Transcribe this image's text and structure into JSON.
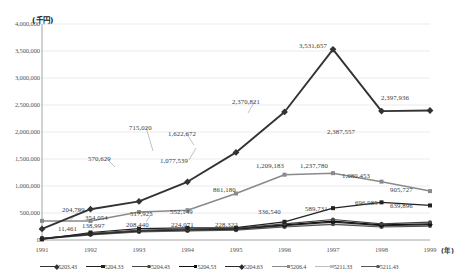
{
  "chart_data": {
    "type": "line",
    "title": "",
    "ylabel": "(千円)",
    "xlabel": "(年)",
    "ylim": [
      0,
      4000000
    ],
    "ytick_labels": [
      "4,000,000",
      "3,500,000",
      "3,000,000",
      "2,500,000",
      "2,000,000",
      "1,500,000",
      "1,000,000",
      "500,000",
      "0"
    ],
    "ytick_values": [
      4000000,
      3500000,
      3000000,
      2500000,
      2000000,
      1500000,
      1000000,
      500000,
      0
    ],
    "grid": true,
    "legend_position": "bottom",
    "categories": [
      "1991",
      "1992",
      "1993",
      "1994",
      "1995",
      "1996",
      "1997",
      "1998",
      "1999"
    ],
    "series": [
      {
        "name": "5203.43",
        "color": "#333333",
        "marker": "diamond",
        "values": [
          204799,
          570629,
          715020,
          1077539,
          1622672,
          2370821,
          3531657,
          2387557,
          2397936
        ],
        "labels": [
          "204,799",
          "570,629",
          "715,020",
          "1,077,539",
          "1,622,672",
          "2,370,821",
          "3,531,657",
          "2,387,557",
          "2,397,936"
        ]
      },
      {
        "name": "5204.33",
        "color": "#222222",
        "marker": "square",
        "values": [
          11461,
          138997,
          208440,
          224071,
          228322,
          336540,
          589731,
          696985,
          639896
        ],
        "labels": [
          "11,461",
          "138,997",
          "208,440",
          "224,071",
          "228,322",
          "336,540",
          "589,731",
          "696,985",
          "639,896"
        ]
      },
      {
        "name": "5204.43",
        "color": "#444444",
        "marker": "circle",
        "values": [
          30000,
          120000,
          180000,
          200000,
          215000,
          300000,
          380000,
          300000,
          330000
        ],
        "labels": [
          "",
          "",
          "",
          "",
          "",
          "",
          "",
          "",
          ""
        ]
      },
      {
        "name": "5204.53",
        "color": "#111111",
        "marker": "square",
        "values": [
          28000,
          115000,
          175000,
          195000,
          210000,
          280000,
          350000,
          280000,
          300000
        ],
        "labels": [
          "",
          "",
          "",
          "",
          "",
          "",
          "",
          "",
          ""
        ]
      },
      {
        "name": "5204.63",
        "color": "#2b2b2b",
        "marker": "diamond",
        "values": [
          25000,
          110000,
          170000,
          185000,
          200000,
          265000,
          330000,
          265000,
          285000
        ],
        "labels": [
          "",
          "",
          "",
          "",
          "",
          "",
          "",
          "",
          ""
        ]
      },
      {
        "name": "5206.4",
        "color": "#8a8a8a",
        "marker": "square",
        "values": [
          354054,
          354054,
          517925,
          552149,
          861180,
          1209183,
          1237780,
          1080453,
          905727
        ],
        "labels": [
          "354,054",
          "",
          "517,925",
          "552,149",
          "861,180",
          "1,209,183",
          "1,237,780",
          "1,080,453",
          "905,727"
        ]
      },
      {
        "name": "5211.33",
        "color": "#bdbdbd",
        "marker": "square",
        "values": [
          20000,
          100000,
          160000,
          175000,
          190000,
          250000,
          300000,
          250000,
          270000
        ],
        "labels": [
          "",
          "",
          "",
          "",
          "",
          "",
          "",
          "",
          ""
        ]
      },
      {
        "name": "5211.43",
        "color": "#555555",
        "marker": "circle",
        "values": [
          18000,
          95000,
          150000,
          168000,
          182000,
          240000,
          290000,
          240000,
          258000
        ],
        "labels": [
          "",
          "",
          "",
          "",
          "",
          "",
          "",
          "",
          ""
        ]
      }
    ],
    "annotations": [
      {
        "text": "204,799",
        "x": 62,
        "y": 206,
        "align": "left"
      },
      {
        "text": "570,629",
        "x": 88,
        "y": 155,
        "align": "left"
      },
      {
        "text": "715,020",
        "x": 129,
        "y": 124,
        "align": "left"
      },
      {
        "text": "1,077,539",
        "x": 160,
        "y": 157,
        "align": "left"
      },
      {
        "text": "1,622,672",
        "x": 168,
        "y": 130,
        "align": "left"
      },
      {
        "text": "2,370,821",
        "x": 232,
        "y": 98,
        "align": "left"
      },
      {
        "text": "3,531,657",
        "x": 299,
        "y": 42,
        "align": "left"
      },
      {
        "text": "2,387,557",
        "x": 327,
        "y": 128,
        "align": "left"
      },
      {
        "text": "2,397,936",
        "x": 381,
        "y": 94,
        "align": "left"
      },
      {
        "text": "11,461",
        "x": 58,
        "y": 225,
        "align": "left"
      },
      {
        "text": "354,054",
        "x": 85,
        "y": 214,
        "align": "left"
      },
      {
        "text": "138,997",
        "x": 82,
        "y": 222,
        "align": "left"
      },
      {
        "text": "208,440",
        "x": 126,
        "y": 221,
        "align": "left"
      },
      {
        "text": "517,925",
        "x": 130,
        "y": 210,
        "align": "left"
      },
      {
        "text": "552,149",
        "x": 170,
        "y": 208,
        "align": "left"
      },
      {
        "text": "224,071",
        "x": 171,
        "y": 221,
        "align": "left"
      },
      {
        "text": "228,322",
        "x": 215,
        "y": 221,
        "align": "left"
      },
      {
        "text": "861,180",
        "x": 213,
        "y": 186,
        "align": "left"
      },
      {
        "text": "336,540",
        "x": 258,
        "y": 208,
        "align": "left"
      },
      {
        "text": "1,209,183",
        "x": 256,
        "y": 162,
        "align": "left"
      },
      {
        "text": "1,237,780",
        "x": 300,
        "y": 162,
        "align": "left"
      },
      {
        "text": "589,731",
        "x": 305,
        "y": 205,
        "align": "left"
      },
      {
        "text": "1,080,453",
        "x": 342,
        "y": 172,
        "align": "left"
      },
      {
        "text": "696,985",
        "x": 355,
        "y": 199,
        "align": "left"
      },
      {
        "text": "905,727",
        "x": 390,
        "y": 186,
        "align": "left"
      },
      {
        "text": "639,896",
        "x": 390,
        "y": 202,
        "align": "left"
      }
    ],
    "leaders": [
      {
        "x1": 80,
        "y1": 209,
        "x2": 69,
        "y2": 222
      },
      {
        "x1": 106,
        "y1": 158,
        "x2": 115,
        "y2": 167
      },
      {
        "x1": 146,
        "y1": 127,
        "x2": 153,
        "y2": 151
      },
      {
        "x1": 189,
        "y1": 160,
        "x2": 196,
        "y2": 148
      },
      {
        "x1": 186,
        "y1": 133,
        "x2": 194,
        "y2": 145
      },
      {
        "x1": 255,
        "y1": 101,
        "x2": 248,
        "y2": 113
      },
      {
        "x1": 152,
        "y1": 213,
        "x2": 146,
        "y2": 222
      }
    ]
  },
  "plot": {
    "left": 42,
    "right": 430,
    "top": 24,
    "bottom": 240
  }
}
